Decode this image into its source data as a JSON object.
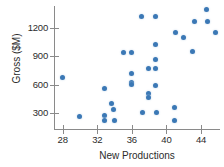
{
  "chart_data": {
    "type": "scatter",
    "title": "",
    "xlabel": "New Productions",
    "ylabel": "Gross ($M)",
    "xlim": [
      27.0,
      46.2
    ],
    "ylim": [
      130,
      1430
    ],
    "grid": false,
    "legend": "none",
    "xticks": [
      28,
      32,
      36,
      40,
      44
    ],
    "yticks": [
      300,
      600,
      900,
      1200
    ],
    "point_color": "#3b78b5",
    "axis_color": "#8a8a8a",
    "text_color": "#2b2b2b",
    "points": [
      {
        "x": 28.0,
        "y": 670
      },
      {
        "x": 30.0,
        "y": 265
      },
      {
        "x": 32.8,
        "y": 560
      },
      {
        "x": 32.8,
        "y": 275
      },
      {
        "x": 32.8,
        "y": 225
      },
      {
        "x": 33.6,
        "y": 400
      },
      {
        "x": 33.9,
        "y": 340
      },
      {
        "x": 34.0,
        "y": 215
      },
      {
        "x": 35.0,
        "y": 940
      },
      {
        "x": 36.0,
        "y": 940
      },
      {
        "x": 36.0,
        "y": 720
      },
      {
        "x": 36.0,
        "y": 625
      },
      {
        "x": 36.0,
        "y": 600
      },
      {
        "x": 37.1,
        "y": 1320
      },
      {
        "x": 37.2,
        "y": 300
      },
      {
        "x": 37.9,
        "y": 770
      },
      {
        "x": 37.9,
        "y": 505
      },
      {
        "x": 37.9,
        "y": 460
      },
      {
        "x": 38.7,
        "y": 1320
      },
      {
        "x": 38.7,
        "y": 1020
      },
      {
        "x": 38.7,
        "y": 860
      },
      {
        "x": 38.7,
        "y": 765
      },
      {
        "x": 38.7,
        "y": 595
      },
      {
        "x": 38.8,
        "y": 300
      },
      {
        "x": 40.9,
        "y": 360
      },
      {
        "x": 40.9,
        "y": 220
      },
      {
        "x": 41.0,
        "y": 1150
      },
      {
        "x": 42.0,
        "y": 1100
      },
      {
        "x": 43.0,
        "y": 945
      },
      {
        "x": 43.3,
        "y": 1270
      },
      {
        "x": 44.6,
        "y": 1390
      },
      {
        "x": 44.7,
        "y": 1270
      },
      {
        "x": 45.7,
        "y": 1150
      }
    ]
  }
}
